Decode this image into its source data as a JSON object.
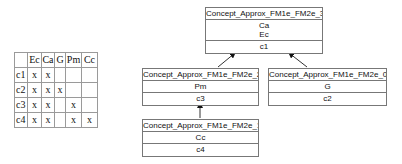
{
  "context_table": {
    "columns": [
      "",
      "Ec",
      "Ca",
      "G",
      "Pm",
      "Cc"
    ],
    "rows": [
      {
        "object": "c1",
        "cells": [
          "x",
          "x",
          "",
          "",
          ""
        ]
      },
      {
        "object": "c2",
        "cells": [
          "x",
          "x",
          "x",
          "",
          ""
        ]
      },
      {
        "object": "c3",
        "cells": [
          "x",
          "x",
          "",
          "x",
          ""
        ]
      },
      {
        "object": "c4",
        "cells": [
          "x",
          "x",
          "",
          "x",
          "x"
        ]
      }
    ]
  },
  "lattice": {
    "concepts": [
      {
        "id": "c3",
        "name": "Concept_Approx_FM1e_FM2e_3",
        "attributes": [
          "Ca",
          "Ec"
        ],
        "objects": [
          "c1"
        ]
      },
      {
        "id": "c2",
        "name": "Concept_Approx_FM1e_FM2e_2",
        "attributes": [
          "Pm"
        ],
        "objects": [
          "c3"
        ]
      },
      {
        "id": "c0",
        "name": "Concept_Approx_FM1e_FM2e_0",
        "attributes": [
          "G"
        ],
        "objects": [
          "c2"
        ]
      },
      {
        "id": "c1",
        "name": "Concept_Approx_FM1e_FM2e_1",
        "attributes": [
          "Cc"
        ],
        "objects": [
          "c4"
        ]
      }
    ],
    "edges": [
      {
        "from": "Concept_Approx_FM1e_FM2e_2",
        "to": "Concept_Approx_FM1e_FM2e_3"
      },
      {
        "from": "Concept_Approx_FM1e_FM2e_0",
        "to": "Concept_Approx_FM1e_FM2e_3"
      },
      {
        "from": "Concept_Approx_FM1e_FM2e_1",
        "to": "Concept_Approx_FM1e_FM2e_2"
      }
    ]
  }
}
